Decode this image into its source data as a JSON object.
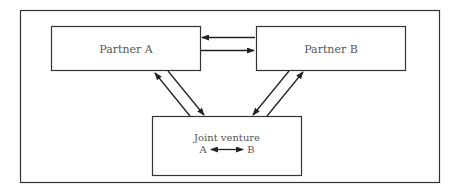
{
  "diagram": {
    "type": "relationship",
    "colors": {
      "stroke": "#333333",
      "text": "#555555",
      "background": "#ffffff"
    },
    "frame": {
      "x": 20,
      "y": 10,
      "w": 420,
      "h": 173
    },
    "nodes": [
      {
        "id": "partner_a",
        "label": "Partner A",
        "x": 51,
        "y": 26,
        "w": 150,
        "h": 45
      },
      {
        "id": "partner_b",
        "label": "Partner B",
        "x": 256,
        "y": 26,
        "w": 150,
        "h": 45
      },
      {
        "id": "joint_venture",
        "label": "Joint venture",
        "x": 152,
        "y": 116,
        "w": 150,
        "h": 60,
        "inner_relation": {
          "left": "A",
          "right": "B",
          "arrow": "bidirectional"
        }
      }
    ],
    "edges": [
      {
        "from": "partner_b",
        "to": "partner_a",
        "direction": "left"
      },
      {
        "from": "partner_a",
        "to": "partner_b",
        "direction": "right"
      },
      {
        "from": "joint_venture",
        "to": "partner_a",
        "direction": "up-left"
      },
      {
        "from": "partner_a",
        "to": "joint_venture",
        "direction": "down-right"
      },
      {
        "from": "partner_b",
        "to": "joint_venture",
        "direction": "down-left"
      },
      {
        "from": "joint_venture",
        "to": "partner_b",
        "direction": "up-right"
      }
    ]
  }
}
